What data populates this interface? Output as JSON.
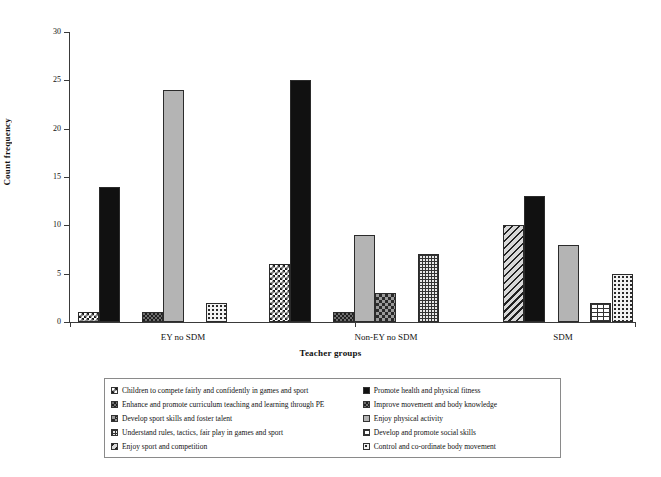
{
  "chart_data": {
    "type": "bar",
    "title": "",
    "xlabel": "Teacher groups",
    "ylabel": "Count frequency",
    "categories": [
      "EY no SDM",
      "Non-EY no SDM",
      "SDM"
    ],
    "ylim": [
      0,
      30
    ],
    "yticks": [
      0,
      5,
      10,
      15,
      20,
      25,
      30
    ],
    "grid": false,
    "legend_position": "bottom",
    "series": [
      {
        "name": "Children to compete fairly and confidently in games and sport",
        "pattern": "checker-white",
        "values": [
          1,
          6,
          0
        ]
      },
      {
        "name": "Promote health and physical fitness",
        "pattern": "solid-black",
        "values": [
          14,
          25,
          13
        ]
      },
      {
        "name": "Enhance and promote curriculum teaching and learning through PE",
        "pattern": "checker-dark",
        "values": [
          1,
          1,
          0
        ]
      },
      {
        "name": "Improve movement and body knowledge",
        "pattern": "light-gray",
        "values": [
          24,
          9,
          8
        ]
      },
      {
        "name": "Develop sport skills and foster talent",
        "pattern": "diamond",
        "values": [
          0,
          3,
          0
        ]
      },
      {
        "name": "Enjoy physical activity",
        "pattern": "dotted",
        "values": [
          2,
          0,
          5
        ]
      },
      {
        "name": "Understand rules, tactics, fair play in games and sport",
        "pattern": "grid",
        "values": [
          0,
          7,
          0
        ]
      },
      {
        "name": "Develop and promote social skills",
        "pattern": "brick",
        "values": [
          0,
          0,
          2
        ]
      },
      {
        "name": "Enjoy sport and competition",
        "pattern": "diagonal",
        "values": [
          0,
          0,
          10
        ]
      },
      {
        "name": "Control and co-ordinate body movement",
        "pattern": "dotted",
        "values": [
          0,
          0,
          0
        ]
      }
    ]
  },
  "axes": {
    "y_label": "Count frequency",
    "x_label": "Teacher groups",
    "y_ticks": [
      "0",
      "5",
      "10",
      "15",
      "20",
      "25",
      "30"
    ],
    "x_groups": [
      "EY no SDM",
      "Non-EY no SDM",
      "SDM"
    ]
  },
  "bars": [
    {
      "group": "EY no SDM",
      "label": "Children to compete fairly and confidently in games and sport",
      "pattern": "checker-white",
      "value": 1,
      "x": 78,
      "w": 21
    },
    {
      "group": "EY no SDM",
      "label": "Promote health and physical fitness",
      "pattern": "solid-black",
      "value": 14,
      "x": 99,
      "w": 21
    },
    {
      "group": "EY no SDM",
      "label": "Enhance and promote curriculum teaching and learning through PE",
      "pattern": "checker-dark",
      "value": 1,
      "x": 142,
      "w": 21
    },
    {
      "group": "EY no SDM",
      "label": "Improve movement and body knowledge",
      "pattern": "light-gray",
      "value": 24,
      "x": 163,
      "w": 21
    },
    {
      "group": "EY no SDM",
      "label": "Enjoy physical activity",
      "pattern": "dotted",
      "value": 2,
      "x": 206,
      "w": 21
    },
    {
      "group": "Non-EY no SDM",
      "label": "Children to compete fairly and confidently in games and sport",
      "pattern": "checker-white",
      "value": 6,
      "x": 269,
      "w": 21
    },
    {
      "group": "Non-EY no SDM",
      "label": "Promote health and physical fitness",
      "pattern": "solid-black",
      "value": 25,
      "x": 290,
      "w": 21
    },
    {
      "group": "Non-EY no SDM",
      "label": "Enhance and promote curriculum teaching and learning through PE",
      "pattern": "checker-dark",
      "value": 1,
      "x": 333,
      "w": 21
    },
    {
      "group": "Non-EY no SDM",
      "label": "Improve movement and body knowledge",
      "pattern": "light-gray",
      "value": 9,
      "x": 354,
      "w": 21
    },
    {
      "group": "Non-EY no SDM",
      "label": "Develop sport skills and foster talent",
      "pattern": "diamond",
      "value": 3,
      "x": 375,
      "w": 21
    },
    {
      "group": "Non-EY no SDM",
      "label": "Understand rules, tactics, fair play in games and sport",
      "pattern": "grid",
      "value": 7,
      "x": 418,
      "w": 21
    },
    {
      "group": "SDM",
      "label": "Enjoy sport and competition",
      "pattern": "diagonal",
      "value": 10,
      "x": 503,
      "w": 21
    },
    {
      "group": "SDM",
      "label": "Promote health and physical fitness",
      "pattern": "solid-black",
      "value": 13,
      "x": 524,
      "w": 21
    },
    {
      "group": "SDM",
      "label": "Improve movement and body knowledge",
      "pattern": "light-gray",
      "value": 8,
      "x": 558,
      "w": 21
    },
    {
      "group": "SDM",
      "label": "Develop and promote social skills",
      "pattern": "brick",
      "value": 2,
      "x": 590,
      "w": 21
    },
    {
      "group": "SDM",
      "label": "Enjoy physical activity",
      "pattern": "dotted",
      "value": 5,
      "x": 612,
      "w": 21
    }
  ],
  "legend": {
    "left_column": [
      {
        "label": "Children to compete fairly and confidently in games and sport",
        "pattern": "checker-white"
      },
      {
        "label": "Enhance and promote curriculum teaching and learning through PE",
        "pattern": "checker-dark"
      },
      {
        "label": "Develop sport skills and foster talent",
        "pattern": "diamond"
      },
      {
        "label": "Understand rules, tactics, fair play in games and sport",
        "pattern": "grid"
      },
      {
        "label": "Enjoy sport and competition",
        "pattern": "diagonal"
      }
    ],
    "right_column": [
      {
        "label": "Promote health and physical fitness",
        "pattern": "solid-black"
      },
      {
        "label": "Improve movement and body knowledge",
        "pattern": "checker-dark"
      },
      {
        "label": "Enjoy physical activity",
        "pattern": "light-gray"
      },
      {
        "label": "Develop and promote social skills",
        "pattern": "brick"
      },
      {
        "label": "Control and co-ordinate body movement",
        "pattern": "dotted"
      }
    ]
  },
  "group_tick_positions": [
    70,
    355,
    635
  ],
  "group_label_positions": [
    183,
    386,
    563
  ]
}
